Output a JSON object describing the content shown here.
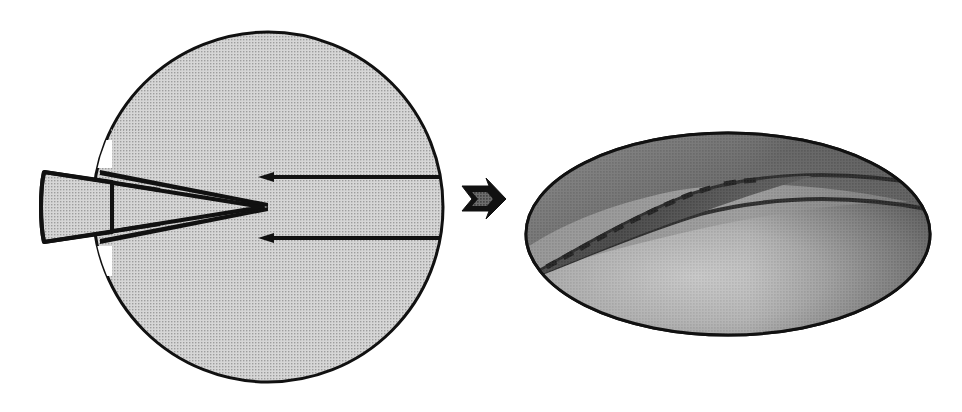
{
  "figure": {
    "background_color": "#ffffff",
    "ink_color": "#111111",
    "panels": [
      {
        "id": "undeformed",
        "name": "undeformed-disc",
        "label": "",
        "shape": "circle",
        "center_x": 268,
        "center_y": 207,
        "radius": 175,
        "fill_color": "#c9c9c9",
        "stroke_color": "#111111",
        "stroke_width": 3,
        "features": [
          {
            "name": "wedge-notch",
            "type": "v-wedge",
            "description": "V-shaped wedge inserted from the left edge, apex pointing right toward the centre",
            "apex_x": 268,
            "apex_y": 207,
            "mouth_top_y": 172,
            "mouth_bottom_y": 242,
            "outer_left_x": 42,
            "fill_color": "#c9c9c9",
            "gap_color": "#ffffff"
          },
          {
            "name": "upper-slip-line",
            "type": "arrow-line",
            "x1": 268,
            "y1": 177,
            "x2": 443,
            "y2": 177,
            "arrow_direction": "left"
          },
          {
            "name": "lower-slip-line",
            "type": "arrow-line",
            "x1": 268,
            "y1": 238,
            "x2": 443,
            "y2": 238,
            "arrow_direction": "left"
          },
          {
            "name": "upper-dotted-chord",
            "type": "dotted-line",
            "x1": 112,
            "y1": 130,
            "x2": 425,
            "y2": 130
          }
        ]
      },
      {
        "id": "deformed",
        "name": "deformed-ellipse",
        "label": "",
        "shape": "ellipse",
        "center_x": 728,
        "center_y": 234,
        "radius_x": 202,
        "radius_y": 101,
        "fill_color": "#9a9a9a",
        "stroke_color": "#111111",
        "stroke_width": 3,
        "features": [
          {
            "name": "shear-crack",
            "type": "curved-slit",
            "description": "Thin curved crack running up-right from lower-left of ellipse",
            "start_x": 536,
            "start_y": 272,
            "end_x": 930,
            "end_y": 206
          },
          {
            "name": "crack-centre-dashed-line",
            "type": "dashed-line",
            "description": "Dashed line tracing the original notch plane inside the crack",
            "start_x": 534,
            "start_y": 274,
            "end_x": 713,
            "end_y": 186
          },
          {
            "name": "upper-shade-band",
            "type": "gradient-region",
            "shade": "dark"
          },
          {
            "name": "lower-shade-band",
            "type": "gradient-region",
            "shade": "light"
          }
        ]
      }
    ],
    "connector": {
      "name": "transformation-arrow",
      "type": "arrow",
      "direction": "right",
      "x": 460,
      "y": 198,
      "width": 42,
      "height": 28,
      "fill_color": "#111111",
      "label": ""
    }
  }
}
